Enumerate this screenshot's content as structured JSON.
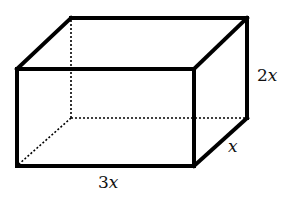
{
  "diagram": {
    "type": "rectangular-prism",
    "dimensions": {
      "height": {
        "coef": "2",
        "var": "x",
        "label": "2x"
      },
      "depth": {
        "coef": "",
        "var": "x",
        "label": "x"
      },
      "width": {
        "coef": "3",
        "var": "x",
        "label": "3x"
      }
    },
    "colors": {
      "stroke": "#000000",
      "background": "#ffffff"
    }
  }
}
